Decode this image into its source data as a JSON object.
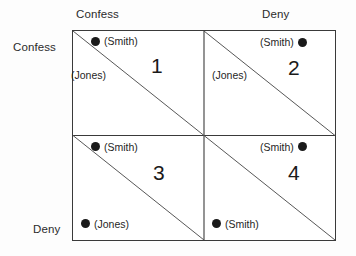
{
  "figure": {
    "type": "payoff-matrix",
    "rows": 2,
    "columns": 2
  },
  "headers": {
    "column_left": "Confess",
    "column_right": "Deny",
    "row_top": "Confess",
    "row_bottom": "Deny"
  },
  "cells": [
    {
      "number": "1",
      "markers": [
        {
          "id": "q1-smith",
          "label": "(Smith)",
          "dot_side": "left"
        },
        {
          "id": "q1-jones",
          "label": "(Jones)",
          "dot_side": "stacked"
        }
      ]
    },
    {
      "number": "2",
      "markers": [
        {
          "id": "q2-smith",
          "label": "(Smith)",
          "dot_side": "right"
        },
        {
          "id": "q2-jones",
          "label": "(Jones)",
          "dot_side": "stacked"
        }
      ]
    },
    {
      "number": "3",
      "markers": [
        {
          "id": "q3-smith",
          "label": "(Smith)",
          "dot_side": "left"
        },
        {
          "id": "q3-jones",
          "label": "(Jones)",
          "dot_side": "left"
        }
      ]
    },
    {
      "number": "4",
      "markers": [
        {
          "id": "q4-smith-top",
          "label": "(Smith)",
          "dot_side": "right"
        },
        {
          "id": "q4-smith-bottom",
          "label": "(Smith)",
          "dot_side": "left"
        }
      ]
    }
  ],
  "colors": {
    "background": "#fdfdfd",
    "cell_background": "#ffffff",
    "border": "#3a3a3a",
    "diagonal": "#555555",
    "dot": "#1a1a1a",
    "text": "#1a1a1a"
  }
}
